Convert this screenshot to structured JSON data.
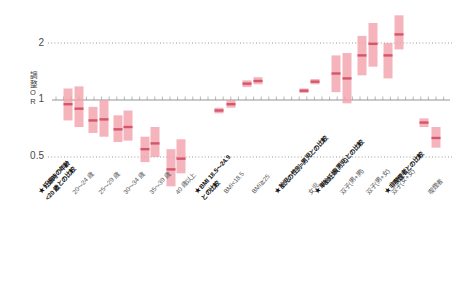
{
  "chart_data": {
    "type": "scatter",
    "plot_kind": "forest-plot-odds-ratio",
    "title": "",
    "xlabel": "",
    "ylabel": "調整OR",
    "yscale": "log",
    "ylim": [
      0.3,
      2.85
    ],
    "yticks": [
      0.5,
      1,
      2
    ],
    "ytick_labels": [
      "0.5",
      "1",
      "2"
    ],
    "grid": "horizontal-dotted",
    "reference_line": 1,
    "legend": "none",
    "marker_color": "#f2a0ab",
    "median_color": "#d4566a",
    "categories": [
      "★妊娠時の年齢 <20歳との比較",
      "20〜24歳",
      "25〜29歳",
      "30〜34歳",
      "35〜39歳",
      "40歳以上",
      "★BMI 18.5〜24.9との比較",
      "BMI<18.5",
      "BMI≧25",
      "★胎児の性別=男児との比較",
      "女児",
      "★単胎妊娠(男児)との比較",
      "双子(男+男)",
      "双子(男+女)",
      "双子(女+女)",
      "★非喫煙者との比較",
      "喫煙者"
    ],
    "points": [
      {
        "label": "20〜24歳 (a)",
        "or": 0.95,
        "low": 1.15,
        "high": 0.78,
        "x": 68
      },
      {
        "label": "20〜24歳 (b)",
        "or": 0.9,
        "low": 1.18,
        "high": 0.72,
        "x": 79
      },
      {
        "label": "25〜29歳 (a)",
        "or": 0.78,
        "low": 0.92,
        "high": 0.67,
        "x": 93
      },
      {
        "label": "25〜29歳 (b)",
        "or": 0.79,
        "low": 1.0,
        "high": 0.64,
        "x": 104
      },
      {
        "label": "30〜34歳 (a)",
        "or": 0.7,
        "low": 0.83,
        "high": 0.6,
        "x": 118
      },
      {
        "label": "30〜34歳 (b)",
        "or": 0.72,
        "low": 0.88,
        "high": 0.61,
        "x": 128
      },
      {
        "label": "35〜39歳 (a)",
        "or": 0.55,
        "low": 0.64,
        "high": 0.47,
        "x": 145
      },
      {
        "label": "35〜39歳 (b)",
        "or": 0.59,
        "low": 0.72,
        "high": 0.5,
        "x": 155
      },
      {
        "label": "40歳以上 (a)",
        "or": 0.43,
        "low": 0.55,
        "high": 0.35,
        "x": 171
      },
      {
        "label": "40歳以上 (b)",
        "or": 0.49,
        "low": 0.62,
        "high": 0.41,
        "x": 181
      },
      {
        "label": "BMI<18.5 (a)",
        "or": 0.88,
        "low": 0.91,
        "high": 0.85,
        "x": 219
      },
      {
        "label": "BMI<18.5 (b)",
        "or": 0.95,
        "low": 1.0,
        "high": 0.91,
        "x": 231
      },
      {
        "label": "BMI≧25 (a)",
        "or": 1.22,
        "low": 1.27,
        "high": 1.17,
        "x": 247
      },
      {
        "label": "BMI≧25 (b)",
        "or": 1.26,
        "low": 1.32,
        "high": 1.21,
        "x": 258
      },
      {
        "label": "女児 (a)",
        "or": 1.12,
        "low": 1.15,
        "high": 1.09,
        "x": 304
      },
      {
        "label": "女児 (b)",
        "or": 1.25,
        "low": 1.29,
        "high": 1.21,
        "x": 315
      },
      {
        "label": "双子(男+男)",
        "or": 1.38,
        "low": 1.72,
        "high": 1.1,
        "x": 336
      },
      {
        "label": "双子(男+男) b",
        "or": 1.3,
        "low": 1.77,
        "high": 0.96,
        "x": 347
      },
      {
        "label": "双子(男+女)",
        "or": 1.72,
        "low": 2.18,
        "high": 1.35,
        "x": 362
      },
      {
        "label": "双子(男+女) b",
        "or": 1.98,
        "low": 2.55,
        "high": 1.5,
        "x": 373
      },
      {
        "label": "双子(女+女)",
        "or": 1.72,
        "low": 2.0,
        "high": 1.3,
        "x": 388
      },
      {
        "label": "双子(女+女) b",
        "or": 2.22,
        "low": 2.8,
        "high": 1.85,
        "x": 399
      },
      {
        "label": "喫煙者 (a)",
        "or": 0.76,
        "low": 0.8,
        "high": 0.72,
        "x": 424
      },
      {
        "label": "喫煙者 (b)",
        "or": 0.63,
        "low": 0.72,
        "high": 0.56,
        "x": 436
      }
    ]
  },
  "axis": {
    "ylabel_chars": [
      "調",
      "整",
      "O",
      "R"
    ],
    "ytick_2": "2",
    "ytick_1": "1",
    "ytick_05": "0.5"
  },
  "xaxis_labels": [
    {
      "id": "age-ref",
      "star": "★",
      "line1": "妊娠時の年齢",
      "line2": "<20 歳との比較",
      "ref": true,
      "x": 36,
      "y": 190
    },
    {
      "id": "age-20-24",
      "star": "",
      "line1": "20〜24 歳",
      "line2": "",
      "ref": false,
      "x": 70,
      "y": 190
    },
    {
      "id": "age-25-29",
      "star": "",
      "line1": "25〜29 歳",
      "line2": "",
      "ref": false,
      "x": 96,
      "y": 190
    },
    {
      "id": "age-30-34",
      "star": "",
      "line1": "30〜34 歳",
      "line2": "",
      "ref": false,
      "x": 121,
      "y": 190
    },
    {
      "id": "age-35-39",
      "star": "",
      "line1": "35〜39 歳",
      "line2": "",
      "ref": false,
      "x": 147,
      "y": 190
    },
    {
      "id": "age-40plus",
      "star": "",
      "line1": "40 歳以上",
      "line2": "",
      "ref": false,
      "x": 173,
      "y": 190
    },
    {
      "id": "bmi-ref",
      "star": "★",
      "line1": "BMI 18.5〜24.9",
      "line2": "との比較",
      "ref": true,
      "x": 192,
      "y": 190
    },
    {
      "id": "bmi-low",
      "star": "",
      "line1": "BMI<18.5",
      "line2": "",
      "ref": false,
      "x": 222,
      "y": 190
    },
    {
      "id": "bmi-high",
      "star": "",
      "line1": "BMI≧25",
      "line2": "",
      "ref": false,
      "x": 250,
      "y": 190
    },
    {
      "id": "sex-ref",
      "star": "★",
      "line1": "胎児の性別=男児との比較",
      "line2": "",
      "ref": true,
      "x": 272,
      "y": 190
    },
    {
      "id": "sex-female",
      "star": "",
      "line1": "女児",
      "line2": "",
      "ref": false,
      "x": 306,
      "y": 190
    },
    {
      "id": "twin-ref",
      "star": "★",
      "line1": "単胎妊娠(男児)との比較",
      "line2": "",
      "ref": true,
      "x": 312,
      "y": 190
    },
    {
      "id": "twin-mm",
      "star": "",
      "line1": "双子(男+男)",
      "line2": "",
      "ref": false,
      "x": 338,
      "y": 190
    },
    {
      "id": "twin-mf",
      "star": "",
      "line1": "双子(男+女)",
      "line2": "",
      "ref": false,
      "x": 364,
      "y": 190
    },
    {
      "id": "twin-ff",
      "star": "",
      "line1": "双子(女+女)",
      "line2": "",
      "ref": false,
      "x": 389,
      "y": 190
    },
    {
      "id": "smoke-ref",
      "star": "★",
      "line1": "非喫煙者との比較",
      "line2": "",
      "ref": true,
      "x": 382,
      "y": 190
    },
    {
      "id": "smoke-yes",
      "star": "",
      "line1": "喫煙者",
      "line2": "",
      "ref": false,
      "x": 426,
      "y": 190
    }
  ]
}
